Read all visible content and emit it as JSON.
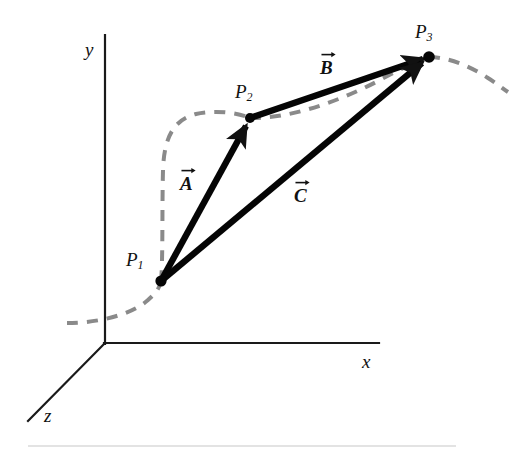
{
  "figure": {
    "type": "diagram",
    "kind": "3d-vector-displacement-diagram",
    "background_color": "#ffffff",
    "ink_color": "#111111",
    "path_color": "#8a8a8a",
    "footer_rule_color": "#e3e3e3"
  },
  "axes": {
    "origin": {
      "x": 105,
      "y": 343
    },
    "y_axis": {
      "label": "y",
      "label_x": 85,
      "label_y": 40,
      "from": {
        "x": 105,
        "y": 343
      },
      "to": {
        "x": 105,
        "y": 35
      }
    },
    "x_axis": {
      "label": "x",
      "label_x": 362,
      "label_y": 352,
      "from": {
        "x": 105,
        "y": 343
      },
      "to": {
        "x": 379,
        "y": 343
      }
    },
    "z_axis": {
      "label": "z",
      "label_x": 44,
      "label_y": 406,
      "from": {
        "x": 105,
        "y": 343
      },
      "to": {
        "x": 28,
        "y": 421
      }
    }
  },
  "points": [
    {
      "name": "P1",
      "label": "P",
      "subscript": "1",
      "x": 161,
      "y": 281,
      "label_x": 126,
      "label_y": 250,
      "radius": 5.5
    },
    {
      "name": "P2",
      "label": "P",
      "subscript": "2",
      "x": 250,
      "y": 118,
      "label_x": 235,
      "label_y": 82,
      "radius": 5.0
    },
    {
      "name": "P3",
      "label": "P",
      "subscript": "3",
      "x": 429,
      "y": 57,
      "label_x": 415,
      "label_y": 22,
      "radius": 5.5
    }
  ],
  "vectors": [
    {
      "name": "A",
      "label": "A",
      "from_point": "P1",
      "to_point": "P2",
      "from": {
        "x": 161,
        "y": 281
      },
      "to": {
        "x": 250,
        "y": 118
      },
      "label_x": 180,
      "label_y": 172
    },
    {
      "name": "B",
      "label": "B",
      "from_point": "P2",
      "to_point": "P3",
      "from": {
        "x": 250,
        "y": 118
      },
      "to": {
        "x": 429,
        "y": 57
      },
      "label_x": 320,
      "label_y": 56
    },
    {
      "name": "C",
      "label": "C",
      "from_point": "P1",
      "to_point": "P3",
      "from": {
        "x": 161,
        "y": 281
      },
      "to": {
        "x": 429,
        "y": 57
      },
      "label_x": 294,
      "label_y": 184
    }
  ],
  "dashed_path": {
    "name": "trajectory",
    "style": "dashed",
    "stroke_width": 4,
    "dash_pattern": "11 9",
    "segments": [
      "M 67 323 C 95 323 130 316 148 300 C 157 292 160 287 161 281",
      "M 161 281 C 163 262 162 205 163 170 C 164 140 172 120 196 114 C 214 110 236 112 250 118",
      "M 250 118 C 290 117 340 100 380 80 C 400 70 416 62 429 57",
      "M 429 57 C 448 57 470 66 488 78 C 496 83 502 87 507 91"
    ]
  },
  "footer_rule": {
    "x": 28,
    "y": 445,
    "width": 428
  }
}
